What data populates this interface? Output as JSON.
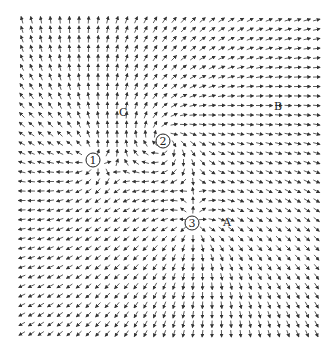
{
  "figure": {
    "type": "vector-field",
    "width": 335,
    "height": 351,
    "grid": {
      "x_start": 22,
      "x_end": 322,
      "y_start": 20,
      "y_end": 338,
      "spacing": 9.5
    },
    "arrow_length": 7,
    "arrow_color": "#333333",
    "background": "#ffffff"
  },
  "critical_points": [
    {
      "id": "1",
      "label": "1",
      "x": 93,
      "y": 160,
      "kind": "source",
      "strength": 1.0,
      "swirl": 0.0
    },
    {
      "id": "2",
      "label": "2",
      "x": 163,
      "y": 141,
      "kind": "spiral-source",
      "strength": 0.9,
      "swirl": 1.4
    },
    {
      "id": "3",
      "label": "3",
      "x": 192,
      "y": 223,
      "kind": "source",
      "strength": 1.0,
      "swirl": 0.0
    }
  ],
  "point_labels": [
    {
      "text": "C",
      "x": 119,
      "y": 107
    },
    {
      "text": "B",
      "x": 274,
      "y": 101
    },
    {
      "text": "A",
      "x": 223,
      "y": 217
    }
  ]
}
